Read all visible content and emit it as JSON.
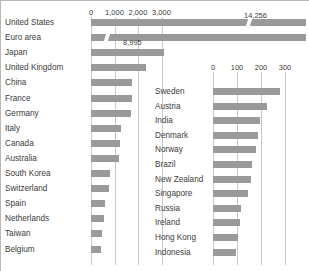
{
  "chart_data": {
    "type": "bar",
    "title": "",
    "subtitle": "",
    "xlabel": "",
    "ylabel": "",
    "grid": true,
    "legend_position": "none",
    "orientation": "horizontal",
    "panels": [
      {
        "name": "left-panel",
        "xlim": [
          0,
          3400
        ],
        "ticks": [
          {
            "label": "0",
            "value": 0
          },
          {
            "label": "1,000",
            "value": 1000
          },
          {
            "label": "2,000",
            "value": 2000
          },
          {
            "label": "3,000",
            "value": 3000
          }
        ],
        "broken_axis": true,
        "categories": [
          "United States",
          "Euro area",
          "Japan",
          "United Kingdom",
          "China",
          "France",
          "Germany",
          "Italy",
          "Canada",
          "Australia",
          "South Korea",
          "Switzerland",
          "Spain",
          "Netherlands",
          "Taiwan",
          "Belgium"
        ],
        "values": [
          14256,
          8995,
          3100,
          2320,
          1750,
          1730,
          1700,
          1280,
          1215,
          1200,
          820,
          760,
          580,
          540,
          480,
          430
        ],
        "data_labels": [
          "14,256",
          "8,995",
          "",
          "",
          "",
          "",
          "",
          "",
          "",
          "",
          "",
          "",
          "",
          "",
          "",
          ""
        ],
        "truncated": [
          true,
          true,
          false,
          false,
          false,
          false,
          false,
          false,
          false,
          false,
          false,
          false,
          false,
          false,
          false,
          false
        ]
      },
      {
        "name": "right-panel",
        "xlim": [
          0,
          320
        ],
        "ticks": [
          {
            "label": "0",
            "value": 0
          },
          {
            "label": "100",
            "value": 100
          },
          {
            "label": "200",
            "value": 200
          },
          {
            "label": "300",
            "value": 300
          }
        ],
        "broken_axis": false,
        "categories": [
          "Sweden",
          "Austria",
          "India",
          "Denmark",
          "Norway",
          "Brazil",
          "New Zealand",
          "Singapore",
          "Russia",
          "Ireland",
          "Hong Kong",
          "Indonesia"
        ],
        "values": [
          280,
          225,
          196,
          186,
          181,
          162,
          160,
          146,
          116,
          111,
          106,
          96
        ],
        "data_labels": [
          "",
          "",
          "",
          "",
          "",
          "",
          "",
          "",
          "",
          "",
          "",
          ""
        ],
        "truncated": [
          false,
          false,
          false,
          false,
          false,
          false,
          false,
          false,
          false,
          false,
          false,
          false
        ]
      }
    ],
    "colors": {
      "bar": "#9a9a9a",
      "gridline": "#c9c9c9",
      "text": "#3b3b3b",
      "background": "#ffffff"
    }
  }
}
